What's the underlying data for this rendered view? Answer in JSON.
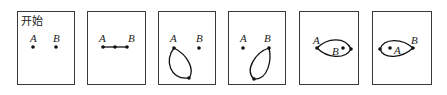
{
  "figure": {
    "panels": [
      {
        "id": "p1",
        "box": [
          17,
          11,
          57,
          73
        ],
        "title": "开始",
        "labels": [
          {
            "text": "A",
            "x": 30,
            "y": 42
          },
          {
            "text": "B",
            "x": 53,
            "y": 42
          }
        ],
        "points": [
          [
            33,
            47
          ],
          [
            56,
            47
          ]
        ],
        "paths": []
      },
      {
        "id": "p2",
        "box": [
          87,
          11,
          58,
          73
        ],
        "title": "",
        "labels": [
          {
            "text": "A",
            "x": 99,
            "y": 42
          },
          {
            "text": "B",
            "x": 128,
            "y": 42
          }
        ],
        "points": [
          [
            103,
            47
          ],
          [
            115,
            47
          ],
          [
            127,
            47
          ]
        ],
        "paths": [
          "M103 47 L127 47"
        ]
      },
      {
        "id": "p3",
        "box": [
          158,
          11,
          57,
          73
        ],
        "title": "",
        "labels": [
          {
            "text": "A",
            "x": 170,
            "y": 42
          },
          {
            "text": "B",
            "x": 196,
            "y": 42
          }
        ],
        "points": [
          [
            174,
            48
          ],
          [
            199,
            48
          ],
          [
            189,
            78
          ]
        ],
        "paths": [
          "M174 48 C164 60, 170 80, 189 78 C195 70, 188 55, 174 48 Z"
        ]
      },
      {
        "id": "p4",
        "box": [
          228,
          11,
          57,
          73
        ],
        "title": "",
        "labels": [
          {
            "text": "A",
            "x": 240,
            "y": 42
          },
          {
            "text": "B",
            "x": 264,
            "y": 42
          }
        ],
        "points": [
          [
            243,
            48
          ],
          [
            269,
            48
          ],
          [
            254,
            79
          ]
        ],
        "paths": [
          "M269 48 C256 52, 244 70, 254 79 C268 80, 272 60, 269 48 Z"
        ]
      },
      {
        "id": "p5",
        "box": [
          299,
          11,
          59,
          73
        ],
        "title": "",
        "labels": [
          {
            "text": "A",
            "x": 313,
            "y": 44
          },
          {
            "text": "B",
            "x": 332,
            "y": 55
          }
        ],
        "points": [
          [
            317,
            48
          ],
          [
            351,
            49
          ],
          [
            343,
            48
          ]
        ],
        "paths": [
          "M317 48 C327 38, 345 36, 351 49 C345 60, 327 58, 317 48 Z"
        ]
      },
      {
        "id": "p6",
        "box": [
          372,
          11,
          59,
          73
        ],
        "title": "",
        "labels": [
          {
            "text": "A",
            "x": 394,
            "y": 54
          },
          {
            "text": "B",
            "x": 411,
            "y": 44
          }
        ],
        "points": [
          [
            380,
            49
          ],
          [
            413,
            48
          ],
          [
            390,
            48
          ]
        ],
        "paths": [
          "M413 48 C402 38, 384 38, 380 49 C384 60, 402 58, 413 48 Z"
        ]
      }
    ]
  }
}
